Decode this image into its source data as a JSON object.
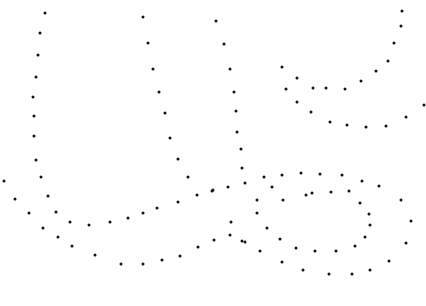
{
  "canvas": {
    "width": 426,
    "height": 306,
    "background": "#ffffff",
    "dot_color": "#111111",
    "dot_size": 3
  },
  "curves": [
    {
      "name": "left-u-outer",
      "points": [
        [
          45,
          13
        ],
        [
          40,
          33
        ],
        [
          38,
          55
        ],
        [
          36,
          77
        ],
        [
          33,
          97
        ],
        [
          34,
          116
        ],
        [
          34,
          136
        ],
        [
          36,
          160
        ],
        [
          41,
          177
        ],
        [
          48,
          196
        ],
        [
          56,
          212
        ],
        [
          70,
          222
        ],
        [
          89,
          225
        ],
        [
          110,
          222
        ],
        [
          128,
          218
        ],
        [
          143,
          213
        ],
        [
          157,
          208
        ],
        [
          178,
          202
        ],
        [
          197,
          195
        ],
        [
          212,
          191
        ]
      ]
    },
    {
      "name": "left-u-inner-right",
      "points": [
        [
          143,
          17
        ],
        [
          148,
          43
        ],
        [
          153,
          69
        ],
        [
          159,
          92
        ],
        [
          165,
          113
        ],
        [
          170,
          138
        ],
        [
          178,
          159
        ],
        [
          188,
          177
        ]
      ]
    },
    {
      "name": "middle-descender",
      "points": [
        [
          216,
          21
        ],
        [
          224,
          44
        ],
        [
          230,
          69
        ],
        [
          234,
          92
        ],
        [
          236,
          111
        ],
        [
          237,
          132
        ],
        [
          241,
          149
        ],
        [
          242,
          168
        ]
      ]
    },
    {
      "name": "left-lower-sweep",
      "points": [
        [
          4,
          181
        ],
        [
          15,
          199
        ],
        [
          29,
          213
        ],
        [
          43,
          228
        ],
        [
          58,
          237
        ],
        [
          72,
          246
        ],
        [
          95,
          255
        ],
        [
          121,
          264
        ],
        [
          143,
          264
        ],
        [
          162,
          260
        ],
        [
          180,
          256
        ],
        [
          198,
          247
        ],
        [
          214,
          240
        ],
        [
          231,
          222
        ],
        [
          245,
          242
        ],
        [
          257,
          213
        ],
        [
          267,
          228
        ],
        [
          272,
          187
        ]
      ]
    },
    {
      "name": "top-right-cup-upper",
      "points": [
        [
          402,
          11
        ],
        [
          401,
          26
        ],
        [
          394,
          43
        ],
        [
          388,
          61
        ],
        [
          376,
          71
        ],
        [
          361,
          81
        ],
        [
          345,
          89
        ],
        [
          326,
          88
        ],
        [
          313,
          88
        ],
        [
          297,
          78
        ],
        [
          282,
          67
        ],
        [
          286,
          89
        ]
      ]
    },
    {
      "name": "top-right-cup-lower",
      "points": [
        [
          297,
          102
        ],
        [
          311,
          112
        ],
        [
          330,
          122
        ],
        [
          347,
          125
        ],
        [
          366,
          127
        ],
        [
          386,
          126
        ],
        [
          406,
          117
        ],
        [
          424,
          105
        ]
      ]
    },
    {
      "name": "loop-outer",
      "points": [
        [
          213,
          190
        ],
        [
          228,
          187
        ],
        [
          245,
          183
        ],
        [
          264,
          177
        ],
        [
          282,
          175
        ],
        [
          301,
          173
        ],
        [
          320,
          174
        ],
        [
          342,
          175
        ],
        [
          362,
          181
        ],
        [
          379,
          186
        ],
        [
          401,
          200
        ],
        [
          411,
          221
        ],
        [
          406,
          243
        ],
        [
          389,
          261
        ],
        [
          370,
          270
        ],
        [
          352,
          274
        ],
        [
          329,
          274
        ],
        [
          303,
          270
        ],
        [
          282,
          262
        ],
        [
          260,
          251
        ],
        [
          242,
          241
        ],
        [
          230,
          235
        ]
      ]
    },
    {
      "name": "loop-inner",
      "points": [
        [
          257,
          200
        ],
        [
          283,
          200
        ],
        [
          306,
          195
        ],
        [
          312,
          193
        ],
        [
          331,
          192
        ],
        [
          349,
          191
        ],
        [
          360,
          203
        ],
        [
          369,
          214
        ],
        [
          370,
          225
        ],
        [
          365,
          237
        ],
        [
          355,
          246
        ],
        [
          336,
          251
        ],
        [
          315,
          251
        ],
        [
          296,
          248
        ],
        [
          280,
          239
        ]
      ]
    }
  ]
}
